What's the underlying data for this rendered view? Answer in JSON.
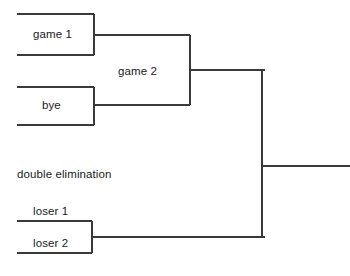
{
  "diagram": {
    "type": "tournament-bracket",
    "caption": "double elimination",
    "background_color": "#ffffff",
    "line_color": "#3a3a3a",
    "text_color": "#1a1a1a",
    "width": 350,
    "height": 276,
    "nodes": [
      {
        "id": "game1",
        "label": "game 1",
        "label_x": 56,
        "label_y": 35,
        "label_position": "inside",
        "box": {
          "x1": 17,
          "y1": 14,
          "x2": 94,
          "y2": 55
        },
        "connector_y": 35
      },
      {
        "id": "bye",
        "label": "bye",
        "label_x": 56,
        "label_y": 106,
        "label_position": "inside",
        "box": {
          "x1": 17,
          "y1": 87,
          "x2": 94,
          "y2": 125
        },
        "connector_y": 105
      },
      {
        "id": "game2",
        "label": "game 2",
        "label_x": 141,
        "label_y": 72,
        "label_position": "inside",
        "box": {
          "x1": 94,
          "y1": 35,
          "x2": 190,
          "y2": 105
        },
        "connector_y": 70
      },
      {
        "id": "loser1",
        "label": "loser 1",
        "label_x": 54,
        "label_y": 212,
        "label_position": "above-line",
        "line_y": 221,
        "line_x1": 17,
        "line_x2": 92
      },
      {
        "id": "loser2",
        "label": "loser 2",
        "label_x": 54,
        "label_y": 244,
        "label_position": "inside",
        "box": {
          "x1": 17,
          "y1": 221,
          "x2": 92,
          "y2": 253
        },
        "connector_y": 237
      },
      {
        "id": "final",
        "label": "",
        "trunk_x": 262,
        "trunk_y1": 70,
        "trunk_y2": 237,
        "output_y": 166,
        "output_x1": 262,
        "output_x2": 350
      }
    ],
    "segments": [
      {
        "name": "game1-top-line",
        "x1": 17,
        "y1": 14,
        "x2": 94,
        "y2": 14
      },
      {
        "name": "game1-bottom-line",
        "x1": 17,
        "y1": 55,
        "x2": 94,
        "y2": 55
      },
      {
        "name": "game1-right-edge",
        "x1": 94,
        "y1": 14,
        "x2": 94,
        "y2": 55
      },
      {
        "name": "game1-to-game2",
        "x1": 94,
        "y1": 35,
        "x2": 190,
        "y2": 35
      },
      {
        "name": "bye-top-line",
        "x1": 17,
        "y1": 87,
        "x2": 94,
        "y2": 87
      },
      {
        "name": "bye-bottom-line",
        "x1": 17,
        "y1": 125,
        "x2": 94,
        "y2": 125
      },
      {
        "name": "bye-right-edge",
        "x1": 94,
        "y1": 87,
        "x2": 94,
        "y2": 125
      },
      {
        "name": "bye-to-game2",
        "x1": 94,
        "y1": 105,
        "x2": 190,
        "y2": 105
      },
      {
        "name": "game2-right-edge",
        "x1": 190,
        "y1": 35,
        "x2": 190,
        "y2": 105
      },
      {
        "name": "game2-to-final",
        "x1": 190,
        "y1": 70,
        "x2": 265,
        "y2": 70
      },
      {
        "name": "final-trunk",
        "x1": 262,
        "y1": 70,
        "x2": 262,
        "y2": 237
      },
      {
        "name": "final-output",
        "x1": 262,
        "y1": 166,
        "x2": 350,
        "y2": 166
      },
      {
        "name": "loser1-line",
        "x1": 17,
        "y1": 221,
        "x2": 92,
        "y2": 221
      },
      {
        "name": "loser2-bottom-line",
        "x1": 17,
        "y1": 253,
        "x2": 92,
        "y2": 253
      },
      {
        "name": "loser-right-edge",
        "x1": 92,
        "y1": 221,
        "x2": 92,
        "y2": 253
      },
      {
        "name": "loser-to-final",
        "x1": 92,
        "y1": 237,
        "x2": 265,
        "y2": 237
      }
    ],
    "caption_position": {
      "x": 17,
      "y": 175
    }
  }
}
